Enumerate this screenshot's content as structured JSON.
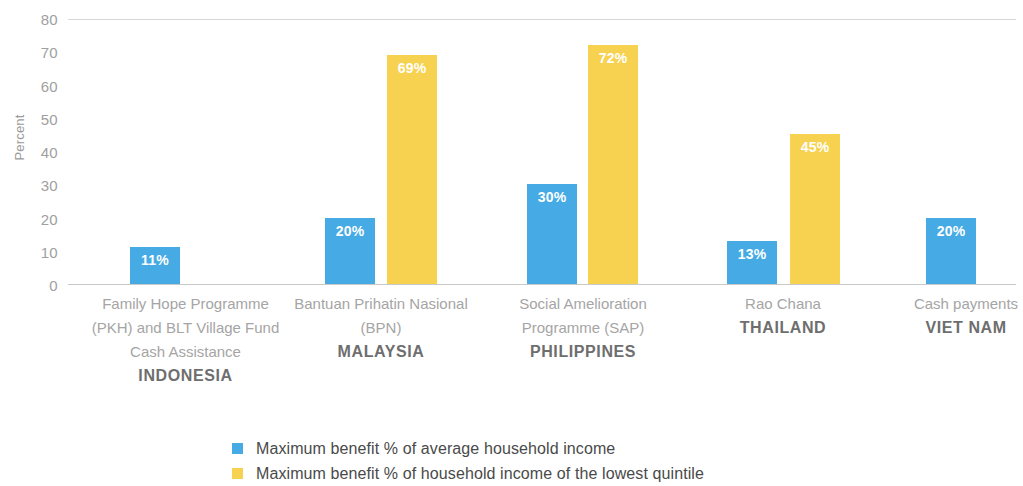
{
  "chart_data": {
    "type": "bar",
    "title": "",
    "subtitle": "",
    "xlabel": "",
    "ylabel": "Percent",
    "ylim": [
      0,
      80
    ],
    "yticks": [
      80,
      70,
      60,
      50,
      40,
      30,
      20,
      10,
      0
    ],
    "grid": "horizontal-top-and-baseline-only",
    "legend_position": "bottom-center",
    "categories": [
      "Family Hope Programme (PKH) and BLT Village Fund Cash Assistance",
      "Bantuan Prihatin Nasional (BPN)",
      "Social Amelioration Programme (SAP)",
      "Rao Chana",
      "Cash payments"
    ],
    "countries": [
      "INDONESIA",
      "MALAYSIA",
      "PHILIPPINES",
      "THAILAND",
      "VIET NAM"
    ],
    "series": [
      {
        "name": "Maximum benefit % of average household income",
        "color": "#46ABE4",
        "values": [
          11,
          20,
          30,
          13,
          20
        ],
        "labels": [
          "11%",
          "20%",
          "30%",
          "13%",
          "20%"
        ]
      },
      {
        "name": "Maximum benefit % of household income of the lowest quintile",
        "color": "#F7D250",
        "values": [
          null,
          69,
          72,
          45,
          null
        ],
        "labels": [
          "",
          "69%",
          "72%",
          "45%",
          ""
        ]
      }
    ]
  },
  "axis": {
    "y_title": "Percent",
    "ticks": [
      "80",
      "70",
      "60",
      "50",
      "40",
      "30",
      "20",
      "10",
      "0"
    ]
  },
  "groups": [
    {
      "programme_lines": [
        "Family Hope",
        "Programme (PKH)",
        "and BLT Village Fund",
        "Cash Assistance"
      ],
      "programme": "Family Hope Programme (PKH) and BLT Village Fund Cash Assistance",
      "country": "INDONESIA",
      "blue_label": "11%",
      "yellow_label": ""
    },
    {
      "programme_lines": [
        "Bantuan Prihatin",
        "Nasional (BPN)"
      ],
      "programme": "Bantuan Prihatin Nasional (BPN)",
      "country": "MALAYSIA",
      "blue_label": "20%",
      "yellow_label": "69%"
    },
    {
      "programme_lines": [
        "Social Amelioration",
        "Programme (SAP)"
      ],
      "programme": "Social Amelioration Programme (SAP)",
      "country": "PHILIPPINES",
      "blue_label": "30%",
      "yellow_label": "72%"
    },
    {
      "programme_lines": [
        "Rao Chana"
      ],
      "programme": "Rao Chana",
      "country": "THAILAND",
      "blue_label": "13%",
      "yellow_label": "45%"
    },
    {
      "programme_lines": [
        "Cash payments"
      ],
      "programme": "Cash payments",
      "country": "VIET NAM",
      "blue_label": "20%",
      "yellow_label": ""
    }
  ],
  "legend": {
    "items": [
      {
        "label": "Maximum benefit % of average household income",
        "color": "#46ABE4"
      },
      {
        "label": "Maximum benefit % of household income of the lowest quintile",
        "color": "#F7D250"
      }
    ]
  },
  "colors": {
    "blue": "#46ABE4",
    "yellow": "#F7D250",
    "gridline": "#d8d8d8",
    "baseline": "#c9c9c9",
    "tick_text": "#a0a0a0",
    "programme_text": "#a5a5a5",
    "country_text": "#6e6e6e",
    "legend_text": "#4a4a4a"
  }
}
